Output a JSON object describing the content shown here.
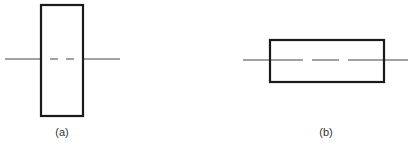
{
  "figures": [
    {
      "id": "a",
      "label": "(a)",
      "orientation": "vertical",
      "rect": {
        "x": 40,
        "y": 4,
        "width": 44,
        "height": 113
      },
      "axis": {
        "y": 59,
        "x1": 5,
        "x2": 120
      },
      "dash_segments": [
        [
          50,
          58
        ],
        [
          66,
          74
        ]
      ]
    },
    {
      "id": "b",
      "label": "(b)",
      "orientation": "horizontal",
      "rect": {
        "x": 270,
        "y": 39,
        "width": 114,
        "height": 43
      },
      "axis": {
        "y": 60,
        "x1": 243,
        "x2": 408
      },
      "dash_segments": [
        [
          270,
          303
        ],
        [
          312,
          339
        ],
        [
          348,
          384
        ]
      ]
    }
  ],
  "colors": {
    "stroke": "#1a1a1a",
    "axis": "#444444",
    "label": "#333333"
  }
}
